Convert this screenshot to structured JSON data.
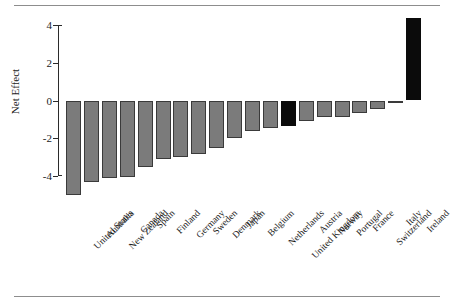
{
  "chart_data": {
    "type": "bar",
    "title": "",
    "xlabel": "",
    "ylabel": "Net Effect",
    "ylim": [
      -5.4,
      4.6
    ],
    "yticks": [
      4,
      2,
      0,
      -2,
      -4
    ],
    "ytick_labels": [
      "4",
      "2",
      "0",
      "-2",
      "-4"
    ],
    "grid": false,
    "legend": false,
    "zero_line": 0,
    "categories": [
      "United States",
      "Australia",
      "New Zealand",
      "Canada",
      "Spain",
      "Finland",
      "Germany",
      "Sweden",
      "Denmark",
      "Japan",
      "Belgium",
      "Netherlands",
      "United Kingdom",
      "Austria",
      "Norway",
      "Portugal",
      "France",
      "Switzerland",
      "Italy",
      "Ireland"
    ],
    "values": [
      -5.0,
      -4.3,
      -4.1,
      -4.05,
      -3.5,
      -3.1,
      -3.0,
      -2.85,
      -2.5,
      -2.0,
      -1.6,
      -1.45,
      -1.35,
      -1.1,
      -0.85,
      -0.85,
      -0.65,
      -0.45,
      -0.05,
      4.35
    ],
    "bar_colors": [
      "grey",
      "grey",
      "grey",
      "grey",
      "grey",
      "grey",
      "grey",
      "grey",
      "grey",
      "grey",
      "grey",
      "grey",
      "black",
      "grey",
      "grey",
      "grey",
      "grey",
      "grey",
      "grey",
      "black"
    ],
    "colors": {
      "grey": "#7b7b7b",
      "black": "#0b0b0b",
      "axis": "#2b2b2b",
      "rule": "#8d8d8d",
      "background": "#ffffff"
    }
  }
}
